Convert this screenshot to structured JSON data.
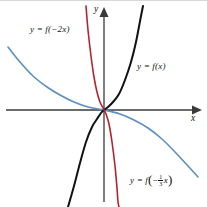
{
  "figure": {
    "background_color": "#ffffff",
    "axis_color": "#3a3a3a",
    "top_rule_color": "#d8d8d8"
  },
  "axes": {
    "x_label": "x",
    "y_label": "y",
    "origin": {
      "x": 104,
      "y": 110
    }
  },
  "labels": {
    "f_of_x": {
      "text": "y = f(x)",
      "color": "#111111"
    },
    "f_of_neg2x": {
      "text": "y = f(−2x)",
      "color": "#111111"
    },
    "f_of_neg_third_x_prefix": {
      "text": "y = f",
      "color": "#111111"
    },
    "f_of_neg_third_x_sign": {
      "text": "−"
    },
    "f_of_neg_third_x_num": {
      "text": "1"
    },
    "f_of_neg_third_x_den": {
      "text": "3"
    },
    "f_of_neg_third_x_var": {
      "text": "x"
    }
  },
  "chart_data": {
    "type": "line",
    "title": "",
    "xlabel": "x",
    "ylabel": "y",
    "grid": false,
    "legend": "inline-annotations",
    "xlim": [
      -104,
      103
    ],
    "ylim": [
      -97,
      110
    ],
    "note": "Three exponential-type curves through the origin; pixel coordinates relative to the 207x207 canvas with origin at (104,110).",
    "series": [
      {
        "name": "y = f(x)",
        "color": "#111111",
        "stroke_width": 2.0,
        "description": "Increasing odd exponential-like curve: steeply negative below-left of origin, flat through origin, steeply positive up-right.",
        "points": [
          [
            68,
            207
          ],
          [
            74,
            186
          ],
          [
            80,
            163
          ],
          [
            86,
            142
          ],
          [
            92,
            127
          ],
          [
            97,
            119
          ],
          [
            101,
            113
          ],
          [
            104,
            110
          ],
          [
            108,
            107
          ],
          [
            113,
            102
          ],
          [
            119,
            94
          ],
          [
            125,
            80
          ],
          [
            131,
            62
          ],
          [
            136,
            42
          ],
          [
            141,
            16
          ],
          [
            143,
            6
          ]
        ]
      },
      {
        "name": "y = f(−2x)",
        "color": "#b62230",
        "stroke_width": 1.6,
        "description": "Horizontal compression and reflection of f(x): decreasing steeply, crossing origin.",
        "points": [
          [
            86,
            6
          ],
          [
            88,
            30
          ],
          [
            91,
            56
          ],
          [
            94,
            77
          ],
          [
            97,
            92
          ],
          [
            100,
            102
          ],
          [
            103,
            108
          ],
          [
            104,
            110
          ],
          [
            106,
            114
          ],
          [
            109,
            124
          ],
          [
            112,
            142
          ],
          [
            115,
            166
          ],
          [
            117,
            188
          ],
          [
            118,
            202
          ],
          [
            119,
            207
          ]
        ]
      },
      {
        "name": "y = f(−⅓x)",
        "color": "#5b8fbe",
        "stroke_width": 1.6,
        "description": "Horizontal stretch and reflection of f(x): gentle decreasing curve from upper-left to lower-right through the origin.",
        "points": [
          [
            8,
            47
          ],
          [
            20,
            62
          ],
          [
            33,
            76
          ],
          [
            47,
            87
          ],
          [
            60,
            95
          ],
          [
            74,
            102
          ],
          [
            88,
            107
          ],
          [
            104,
            110
          ],
          [
            120,
            114
          ],
          [
            134,
            120
          ],
          [
            148,
            128
          ],
          [
            162,
            139
          ],
          [
            175,
            152
          ],
          [
            188,
            166
          ],
          [
            198,
            177
          ]
        ]
      }
    ]
  }
}
